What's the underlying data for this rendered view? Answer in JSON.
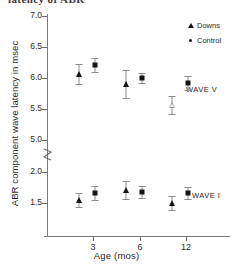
{
  "caption_fragment": "latency  of ABR",
  "axis_titles": {
    "y": "ABR  component wave latency in msec",
    "x": "Age (mos)"
  },
  "legend": {
    "items": [
      {
        "label": "Downs",
        "marker": "triangle-marker",
        "color": "#141414"
      },
      {
        "label": "Control",
        "marker": "circle-marker",
        "color": "#141414"
      }
    ]
  },
  "annotations": [
    {
      "id": "wave-v",
      "text": "WAVE V"
    },
    {
      "id": "wave-i",
      "text": "WAVE I"
    }
  ],
  "y_ticks": [
    {
      "label": "7.0",
      "value": 7.0,
      "y": 16
    },
    {
      "label": "6.5",
      "value": 6.5,
      "y": 47
    },
    {
      "label": "6.0",
      "value": 6.0,
      "y": 78
    },
    {
      "label": "5.5",
      "value": 5.5,
      "y": 109
    },
    {
      "label": "5.0",
      "value": 5.0,
      "y": 140
    },
    {
      "label": "2.0",
      "value": 2.0,
      "y": 172
    },
    {
      "label": "1.5",
      "value": 1.5,
      "y": 203
    }
  ],
  "x_ticks": [
    {
      "label": "3",
      "value": 3,
      "x": 93
    },
    {
      "label": "6",
      "value": 6,
      "x": 140
    },
    {
      "label": "12",
      "value": 12,
      "x": 186
    }
  ],
  "axis_break": {
    "present": true,
    "between": [
      5.0,
      2.0
    ],
    "y": 156
  },
  "chart_data": {
    "type": "scatter",
    "xlabel": "Age (mos)",
    "ylabel": "ABR  component wave latency in msec",
    "x": [
      3,
      6,
      12
    ],
    "x_tick_labels": [
      "3",
      "6",
      "12"
    ],
    "y_tick_labels": [
      "7.0",
      "6.5",
      "6.0",
      "5.5",
      "5.0",
      "2.0",
      "1.5"
    ],
    "ylim_upper_segment": [
      5.0,
      7.0
    ],
    "ylim_lower_segment": [
      1.3,
      2.1
    ],
    "y_axis_broken": true,
    "grid": false,
    "legend_position": "top-right",
    "error_bars": "vertical, capped (SD)",
    "groups": [
      {
        "name": "WAVE V",
        "series": [
          {
            "name": "Downs",
            "marker": "triangle",
            "points": [
              {
                "x": 3,
                "y": 6.06,
                "err": 0.16,
                "px": 79,
                "py": 74,
                "open": false
              },
              {
                "x": 6,
                "y": 5.9,
                "err": 0.22,
                "px": 126,
                "py": 84,
                "open": false
              },
              {
                "x": 12,
                "y": 5.56,
                "err": 0.15,
                "px": 172,
                "py": 105,
                "open": true
              }
            ]
          },
          {
            "name": "Control",
            "marker": "circle",
            "points": [
              {
                "x": 3,
                "y": 6.2,
                "err": 0.12,
                "px": 95,
                "py": 65,
                "open": false
              },
              {
                "x": 6,
                "y": 5.99,
                "err": 0.08,
                "px": 142,
                "py": 78,
                "open": false
              },
              {
                "x": 12,
                "y": 5.92,
                "err": 0.12,
                "px": 188,
                "py": 83,
                "open": false
              }
            ]
          }
        ]
      },
      {
        "name": "WAVE I",
        "series": [
          {
            "name": "Downs",
            "marker": "triangle",
            "points": [
              {
                "x": 3,
                "y": 1.55,
                "err": 0.11,
                "px": 79,
                "py": 200,
                "open": false
              },
              {
                "x": 6,
                "y": 1.71,
                "err": 0.14,
                "px": 126,
                "py": 190,
                "open": false
              },
              {
                "x": 12,
                "y": 1.51,
                "err": 0.12,
                "px": 172,
                "py": 203,
                "open": false
              }
            ]
          },
          {
            "name": "Control",
            "marker": "circle",
            "points": [
              {
                "x": 3,
                "y": 1.67,
                "err": 0.11,
                "px": 95,
                "py": 193,
                "open": false
              },
              {
                "x": 6,
                "y": 1.69,
                "err": 0.09,
                "px": 142,
                "py": 192,
                "open": false
              },
              {
                "x": 12,
                "y": 1.67,
                "err": 0.09,
                "px": 188,
                "py": 193,
                "open": false
              }
            ]
          }
        ]
      }
    ]
  }
}
